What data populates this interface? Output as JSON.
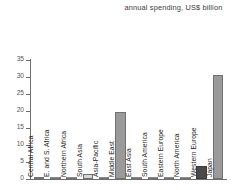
{
  "chart_data": {
    "type": "bar",
    "title": "annual spending, US$ billion",
    "xlabel": "",
    "ylabel": "",
    "ylim": [
      0,
      35
    ],
    "yticks": [
      0,
      5,
      10,
      15,
      20,
      25,
      30,
      35
    ],
    "grid": false,
    "legend": "none",
    "categories": [
      "Central Africa",
      "E. and S. Africa",
      "Northern Africa",
      "South Asia",
      "Asia-Pacific",
      "Middle East",
      "East Asia",
      "South America",
      "Eastern Europe",
      "North America",
      "Western Europe",
      "Japan"
    ],
    "values": [
      0.5,
      0.1,
      0.1,
      1.6,
      0.1,
      19.7,
      0.1,
      0.1,
      0.1,
      0.1,
      3.9,
      30.7
    ],
    "bar_colors": [
      "#9a9a9a",
      "#9a9a9a",
      "#9a9a9a",
      "#d6d6d6",
      "#9a9a9a",
      "#9a9a9a",
      "#9a9a9a",
      "#9a9a9a",
      "#9a9a9a",
      "#9a9a9a",
      "#4a4a4a",
      "#9a9a9a"
    ]
  },
  "colors": {
    "default_bar": "#9a9a9a",
    "highlight_light": "#d6d6d6",
    "highlight_dark": "#4a4a4a",
    "axis": "#6e6e6e",
    "text": "#1d1d1d"
  }
}
